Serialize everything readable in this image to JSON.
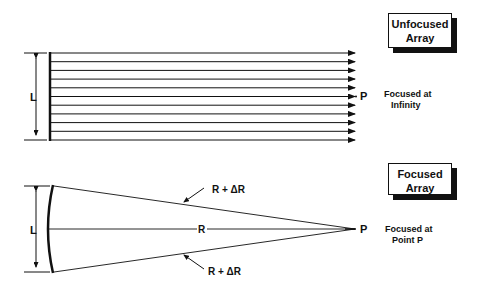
{
  "unfocused": {
    "title_line1": "Unfocused",
    "title_line2": "Array",
    "dimension_label": "L",
    "point_label": "P",
    "note_line1": "Focused at",
    "note_line2": "Infinity",
    "ray_count": 11
  },
  "focused": {
    "title_line1": "Focused",
    "title_line2": "Array",
    "dimension_label": "L",
    "point_label": "P",
    "center_label": "R",
    "upper_label": "R + ΔR",
    "lower_label": "R + ΔR",
    "note_line1": "Focused at",
    "note_line2": "Point P"
  },
  "colors": {
    "ink": "#111111",
    "background": "#ffffff"
  }
}
